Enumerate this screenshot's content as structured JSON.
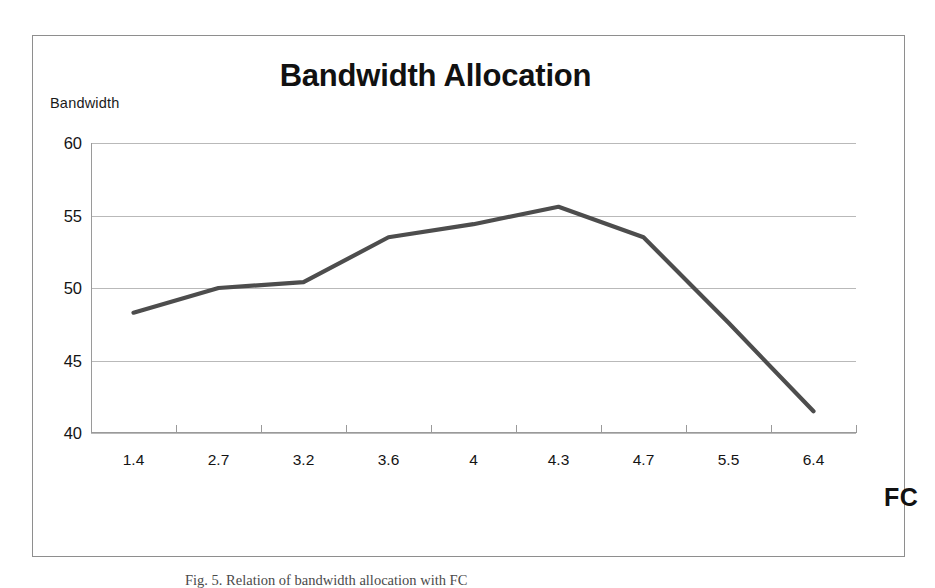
{
  "figure": {
    "caption": "Fig. 5. Relation of bandwidth allocation with FC"
  },
  "chart_data": {
    "type": "line",
    "title": "Bandwidth Allocation",
    "xlabel": "FC",
    "ylabel": "Bandwidth",
    "categories": [
      "1.4",
      "2.7",
      "3.2",
      "3.6",
      "4",
      "4.3",
      "4.7",
      "5.5",
      "6.4"
    ],
    "values": [
      48.3,
      50.0,
      50.4,
      53.5,
      54.4,
      55.6,
      53.5,
      47.6,
      41.5
    ],
    "series": [
      {
        "name": "Bandwidth",
        "values": [
          48.3,
          50.0,
          50.4,
          53.5,
          54.4,
          55.6,
          53.5,
          47.6,
          41.5
        ]
      }
    ],
    "ylim": [
      40,
      60
    ],
    "y_ticks": [
      "40",
      "45",
      "50",
      "55",
      "60"
    ],
    "y_tick_values": [
      40,
      45,
      50,
      55,
      60
    ],
    "grid": true,
    "legend": "none",
    "line_color": "#4d4d4d",
    "grid_color": "#b9b9b9",
    "axis_color": "#9a9a9a",
    "title_color": "#111111",
    "markers": false
  }
}
